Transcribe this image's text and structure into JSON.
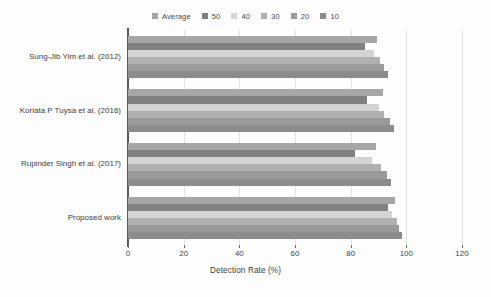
{
  "chart_data": {
    "type": "bar",
    "orientation": "horizontal",
    "title": "",
    "xlabel": "Detection Rate (%)",
    "ylabel": "",
    "xlim": [
      0,
      120
    ],
    "xticks": [
      0,
      20,
      40,
      60,
      80,
      100,
      120
    ],
    "grid": true,
    "legend_position": "top-center",
    "categories": [
      "Sung-Jib Yim et al. (2012)",
      "Koriata P Tuysa et al. (2016)",
      "Rupinder Singh et al. (2017)",
      "Proposed work"
    ],
    "series": [
      {
        "name": "Average",
        "color": "#a6a6a6",
        "values": [
          89.5,
          91.5,
          89.0,
          96.0
        ]
      },
      {
        "name": "50",
        "color": "#808080",
        "values": [
          85.0,
          86.0,
          81.5,
          93.5
        ]
      },
      {
        "name": "40",
        "color": "#d4d4d4",
        "values": [
          88.5,
          90.0,
          87.5,
          95.0
        ]
      },
      {
        "name": "30",
        "color": "#b0b0b0",
        "values": [
          90.5,
          92.0,
          91.0,
          96.5
        ]
      },
      {
        "name": "20",
        "color": "#9a9a9a",
        "values": [
          92.0,
          94.0,
          93.0,
          97.5
        ]
      },
      {
        "name": "10",
        "color": "#8c8c8c",
        "values": [
          93.5,
          95.5,
          94.5,
          98.5
        ]
      }
    ]
  },
  "legend": {
    "entries": [
      {
        "label": "Average",
        "color": "#a6a6a6"
      },
      {
        "label": "50",
        "color": "#808080"
      },
      {
        "label": "40",
        "color": "#d4d4d4"
      },
      {
        "label": "30",
        "color": "#b0b0b0"
      },
      {
        "label": "20",
        "color": "#9a9a9a"
      },
      {
        "label": "10",
        "color": "#8c8c8c"
      }
    ]
  },
  "axis": {
    "x_title": "Detection Rate (%)",
    "x_tick_labels": [
      "0",
      "20",
      "40",
      "60",
      "80",
      "100",
      "120"
    ],
    "y_tick_labels": [
      "Sung-Jib Yim et al. (2012)",
      "Koriata P Tuysa et al. (2016)",
      "Rupinder Singh et al. (2017)",
      "Proposed work"
    ]
  },
  "colors": {
    "axis_line": "#5a5a5a",
    "gridline": "#e3e3e3",
    "background": "#fdfdfd",
    "text": "#3d3d46"
  }
}
